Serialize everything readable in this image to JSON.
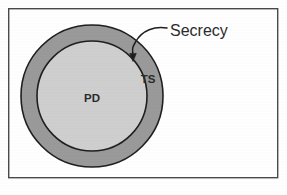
{
  "figure": {
    "width": 287,
    "height": 195,
    "background": "#ffffff"
  },
  "frame": {
    "name": "figure-border",
    "x": 8,
    "y": 8,
    "width": 270,
    "height": 170,
    "stroke": "#4a4a4a",
    "stroke_width": 1.4,
    "fill": "#ffffff"
  },
  "labels": {
    "outer_region": "TS",
    "inner_region": "PD",
    "callout": "Secrecy"
  },
  "colors": {
    "outer_fill": "#9a9a9a",
    "inner_fill": "#cfcfcf",
    "outline": "#1f1f1f",
    "text": "#2b2b2b",
    "leader": "#1f1f1f"
  },
  "chart_data": {
    "type": "diagram",
    "subtype": "concentric-set-venn",
    "title": "Secrecy",
    "regions": [
      {
        "id": "outer-ring",
        "label": "TS",
        "shape": "annulus",
        "center": [
          92,
          96
        ],
        "outer_radius": 71,
        "inner_radius": 55,
        "fill": "#9a9a9a",
        "label_position": [
          148,
          79
        ]
      },
      {
        "id": "inner-disc",
        "label": "PD",
        "shape": "circle",
        "center": [
          92,
          96
        ],
        "radius": 55,
        "fill": "#cfcfcf",
        "label_position": [
          92,
          98
        ]
      }
    ],
    "annotations": [
      {
        "text": "Secrecy",
        "text_position": [
          170,
          32
        ],
        "arrow_tip": [
          133,
          59
        ],
        "points_to": "inner-disc boundary",
        "style": "curved-leader-with-arrowhead"
      }
    ],
    "relationship": "PD is a proper subset of TS; the boundary of PD is labelled Secrecy",
    "legend": null,
    "grid": false
  }
}
